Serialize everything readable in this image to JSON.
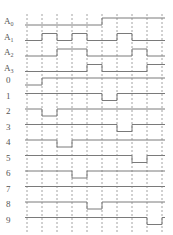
{
  "diagram": {
    "inputs": [
      {
        "name": "A",
        "subscript": "0",
        "levels": [
          0,
          0,
          0,
          0,
          0,
          1,
          1,
          1,
          1
        ]
      },
      {
        "name": "A",
        "subscript": "1",
        "levels": [
          0,
          1,
          0,
          1,
          0,
          0,
          1,
          0,
          0
        ]
      },
      {
        "name": "A",
        "subscript": "2",
        "levels": [
          0,
          0,
          1,
          1,
          0,
          0,
          0,
          1,
          0
        ]
      },
      {
        "name": "A",
        "subscript": "3",
        "levels": [
          0,
          0,
          0,
          0,
          1,
          0,
          0,
          0,
          1
        ]
      }
    ],
    "outputs": [
      {
        "name": "0"
      },
      {
        "name": "1"
      },
      {
        "name": "2"
      },
      {
        "name": "3"
      },
      {
        "name": "4"
      },
      {
        "name": "5"
      },
      {
        "name": "6"
      },
      {
        "name": "7"
      },
      {
        "name": "8"
      },
      {
        "name": "9"
      }
    ],
    "sequence": [
      0,
      2,
      4,
      6,
      8,
      1,
      3,
      5,
      9
    ],
    "output_active_level": "low",
    "colors": {
      "wave": "#7a7a7a",
      "grid": "#8a8a8a",
      "label": "#555555"
    }
  }
}
